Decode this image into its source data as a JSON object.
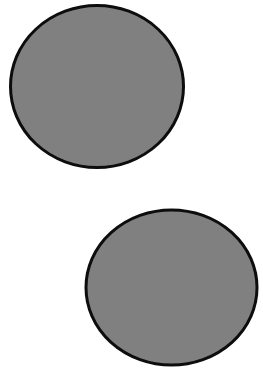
{
  "canvas": {
    "width": 263,
    "height": 371,
    "background_color": "#ffffff",
    "name": "two-gray-circles-image"
  },
  "palette": {
    "fill_gray": "#808080",
    "stroke_black": "#0d0d0d",
    "background_white": "#ffffff"
  },
  "shapes": [
    {
      "id": "circle-top-left",
      "label": "Top left gray circle",
      "type": "ellipse",
      "cx": 97,
      "cy": 86.5,
      "rx": 86.5,
      "ry": 81,
      "fill": "#808080",
      "stroke": "#0d0d0d",
      "stroke_width": 3
    },
    {
      "id": "circle-bottom-right",
      "label": "Bottom right gray circle",
      "type": "ellipse",
      "cx": 171.5,
      "cy": 287.5,
      "rx": 85.5,
      "ry": 77.5,
      "fill": "#808080",
      "stroke": "#0d0d0d",
      "stroke_width": 3
    }
  ]
}
